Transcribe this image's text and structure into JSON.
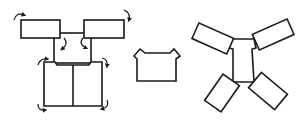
{
  "figure": {
    "panels": [
      {
        "id": "unfolded-net-with-fold-arrows",
        "label": ""
      },
      {
        "id": "folded-front-shape",
        "label": ""
      },
      {
        "id": "rotated-flaps-net",
        "label": ""
      }
    ],
    "colors": {
      "stroke": "#1a1a1a",
      "background": "#ffffff"
    }
  }
}
